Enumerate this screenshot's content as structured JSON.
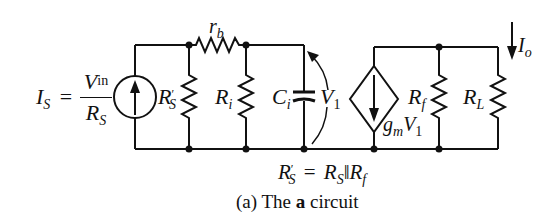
{
  "figure": {
    "caption_prefix": "(a)",
    "caption_word1": "The",
    "caption_bold": "a",
    "caption_word2": "circuit"
  },
  "labels": {
    "source_I": "I",
    "source_I_sub": "S",
    "equals": "=",
    "frac_num_V": "V",
    "frac_num_sub": "in",
    "frac_den_R": "R",
    "frac_den_sub": "S",
    "rb": "r",
    "rb_sub": "b",
    "RSprime": "R",
    "RSprime_prime": "′",
    "RSprime_sub": "S",
    "Ri": "R",
    "Ri_sub": "i",
    "Ci": "C",
    "Ci_sub": "i",
    "V1": "V",
    "V1_sub": "1",
    "gm": "g",
    "gm_sub": "m",
    "gmV": "V",
    "gmV_sub": "1",
    "Rf": "R",
    "Rf_sub": "f",
    "RL": "R",
    "RL_sub": "L",
    "Io": "I",
    "Io_sub": "o",
    "eq2_R1": "R",
    "eq2_R1_prime": "′",
    "eq2_R1_sub": "S",
    "eq2_eq": "=",
    "eq2_R2": "R",
    "eq2_R2_sub": "S",
    "eq2_par": "‖",
    "eq2_R3": "R",
    "eq2_R3_sub": "f"
  },
  "components": [
    {
      "id": "IS",
      "type": "independent-current-source",
      "direction": "up"
    },
    {
      "id": "RSprime",
      "type": "resistor",
      "orientation": "vertical"
    },
    {
      "id": "rb",
      "type": "resistor",
      "orientation": "horizontal"
    },
    {
      "id": "Ri",
      "type": "resistor",
      "orientation": "vertical"
    },
    {
      "id": "Ci",
      "type": "capacitor",
      "orientation": "vertical"
    },
    {
      "id": "gmV1",
      "type": "dependent-current-source",
      "direction": "down"
    },
    {
      "id": "Rf",
      "type": "resistor",
      "orientation": "vertical"
    },
    {
      "id": "RL",
      "type": "resistor",
      "orientation": "vertical"
    }
  ],
  "colors": {
    "ink": "#111111",
    "background": "#ffffff"
  }
}
